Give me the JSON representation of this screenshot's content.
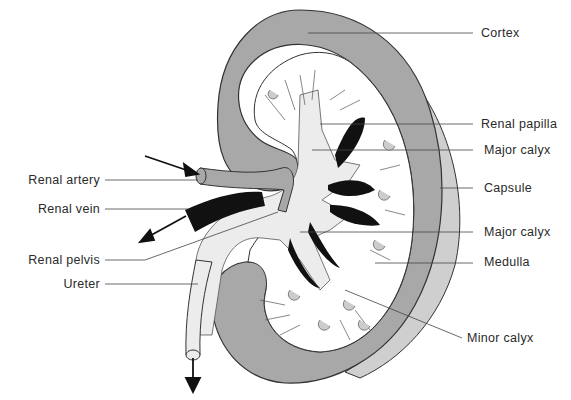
{
  "diagram": {
    "colors": {
      "cortex": "#a8a8a8",
      "capsule": "#cfcfcf",
      "pelvis": "#ececec",
      "vein": "#111111",
      "line": "#333333",
      "background": "#ffffff"
    },
    "labels_left": [
      {
        "id": "renal-artery",
        "text": "Renal artery"
      },
      {
        "id": "renal-vein",
        "text": "Renal vein"
      },
      {
        "id": "renal-pelvis",
        "text": "Renal pelvis"
      },
      {
        "id": "ureter",
        "text": "Ureter"
      }
    ],
    "labels_right": [
      {
        "id": "cortex",
        "text": "Cortex"
      },
      {
        "id": "renal-papilla",
        "text": "Renal papilla"
      },
      {
        "id": "major-calyx-upper",
        "text": "Major calyx"
      },
      {
        "id": "capsule",
        "text": "Capsule"
      },
      {
        "id": "major-calyx-lower",
        "text": "Major calyx"
      },
      {
        "id": "medulla",
        "text": "Medulla"
      },
      {
        "id": "minor-calyx",
        "text": "Minor calyx"
      }
    ]
  }
}
